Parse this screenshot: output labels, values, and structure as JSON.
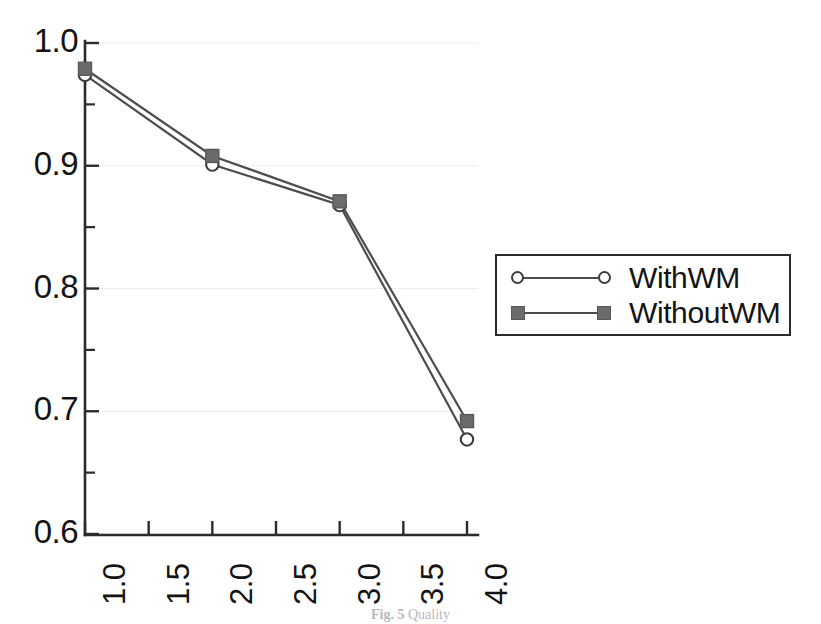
{
  "chart_data": {
    "type": "line",
    "title": "",
    "xlabel": "",
    "ylabel": "",
    "x": [
      1.0,
      2.0,
      3.0,
      4.0
    ],
    "xlim": [
      1.0,
      4.0
    ],
    "ylim": [
      0.6,
      1.0
    ],
    "grid": true,
    "legend_position": "right",
    "xticks": [
      "1.0",
      "1.5",
      "2.0",
      "2.5",
      "3.0",
      "3.5",
      "4.0"
    ],
    "xtick_values": [
      1.0,
      1.5,
      2.0,
      2.5,
      3.0,
      3.5,
      4.0
    ],
    "yticks": [
      "1.0",
      "0.9",
      "0.8",
      "0.7",
      "0.6"
    ],
    "ytick_values": [
      1.0,
      0.9,
      0.8,
      0.7,
      0.6
    ],
    "yticks_minor": [
      0.95,
      0.85,
      0.75,
      0.65
    ],
    "series": [
      {
        "name": "WithWM",
        "marker": "open-circle",
        "color": "#4d4d4d",
        "values": [
          0.974,
          0.901,
          0.868,
          0.677
        ]
      },
      {
        "name": "WithoutWM",
        "marker": "filled-square",
        "color": "#6b6b6b",
        "values": [
          0.979,
          0.908,
          0.871,
          0.692
        ]
      }
    ]
  },
  "legend": {
    "items": [
      {
        "label": "WithWM"
      },
      {
        "label": "WithoutWM"
      }
    ]
  },
  "caption": {
    "prefix": "Fig. 5",
    "text": "Quality"
  },
  "colors": {
    "axis": "#2b2b2b",
    "line": "#4d4d4d",
    "square_marker": "#6b6b6b",
    "circle_marker_fill": "#ffffff",
    "grid": "#ededf2",
    "background": "#ffffff"
  }
}
